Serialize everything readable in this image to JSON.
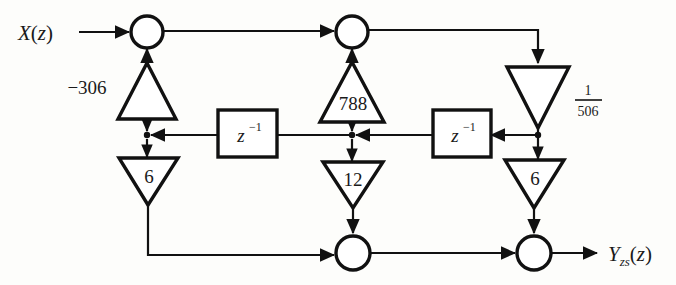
{
  "diagram": {
    "stroke_color": "#111111",
    "background_color": "#fdfdfb",
    "input": {
      "label_main": "X",
      "label_paren_open": "(",
      "label_var": "z",
      "label_paren_close": ")",
      "full": "X(z)"
    },
    "output": {
      "label_main": "Y",
      "label_sub": "zs",
      "label_paren_open": "(",
      "label_var": "z",
      "label_paren_close": ")",
      "full": "Yzs(z)"
    },
    "summing_nodes": [
      {
        "name": "top-left-adder",
        "cx": 147,
        "cy": 32,
        "r": 16
      },
      {
        "name": "top-middle-adder",
        "cx": 352,
        "cy": 32,
        "r": 16
      },
      {
        "name": "bottom-middle-adder",
        "cx": 353,
        "cy": 253,
        "r": 17
      },
      {
        "name": "bottom-right-adder",
        "cx": 534,
        "cy": 253,
        "r": 17
      }
    ],
    "gains": [
      {
        "name": "gain-minus-306",
        "label": "−306",
        "orientation": "up",
        "label_position": "outside-left"
      },
      {
        "name": "gain-788",
        "label": "788",
        "orientation": "up",
        "label_position": "inside"
      },
      {
        "name": "gain-one-over-506",
        "label_numerator": "1",
        "label_denominator": "506",
        "orientation": "down",
        "label_position": "outside-right"
      },
      {
        "name": "gain-6-left",
        "label": "6",
        "orientation": "down",
        "label_position": "inside"
      },
      {
        "name": "gain-12",
        "label": "12",
        "orientation": "down",
        "label_position": "inside"
      },
      {
        "name": "gain-6-right",
        "label": "6",
        "orientation": "down",
        "label_position": "inside"
      }
    ],
    "delays": [
      {
        "name": "delay-block-left",
        "label_base": "z",
        "label_exponent": "−1"
      },
      {
        "name": "delay-block-right",
        "label_base": "z",
        "label_exponent": "−1"
      }
    ]
  }
}
